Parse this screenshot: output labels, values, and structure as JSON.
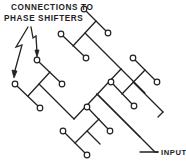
{
  "diagram": {
    "type": "corporate-feed-network",
    "labels": {
      "connections_line1": "CONNECTIONS TO",
      "connections_line2": "PHASE SHIFTERS",
      "input": "INPUT"
    },
    "colors": {
      "stroke": "#222222",
      "background": "#ffffff"
    },
    "output_count": 16,
    "input_count": 1
  }
}
